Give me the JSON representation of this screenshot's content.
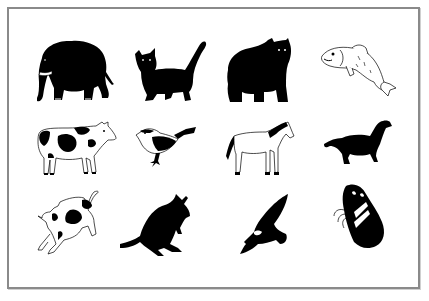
{
  "figure": {
    "frame_color": "#8a8a8a",
    "ink_color": "#000000",
    "paper_color": "#ffffff",
    "grid": {
      "rows": 3,
      "columns": 4
    },
    "animals": [
      {
        "name": "elephant",
        "style": "silhouette",
        "row": 1,
        "col": 1
      },
      {
        "name": "cat",
        "style": "silhouette",
        "row": 1,
        "col": 2
      },
      {
        "name": "bear",
        "style": "silhouette",
        "row": 1,
        "col": 3
      },
      {
        "name": "fish",
        "style": "line-drawing",
        "row": 1,
        "col": 4
      },
      {
        "name": "cow",
        "style": "line-drawing",
        "row": 2,
        "col": 1
      },
      {
        "name": "bird",
        "style": "line-drawing",
        "row": 2,
        "col": 2
      },
      {
        "name": "horse",
        "style": "line-drawing",
        "row": 2,
        "col": 3
      },
      {
        "name": "dog",
        "style": "silhouette",
        "row": 2,
        "col": 4
      },
      {
        "name": "calf",
        "style": "line-drawing",
        "row": 3,
        "col": 1
      },
      {
        "name": "kangaroo",
        "style": "silhouette",
        "row": 3,
        "col": 2
      },
      {
        "name": "eagle",
        "style": "silhouette",
        "row": 3,
        "col": 3
      },
      {
        "name": "butterfly",
        "style": "silhouette",
        "row": 3,
        "col": 4
      }
    ]
  }
}
